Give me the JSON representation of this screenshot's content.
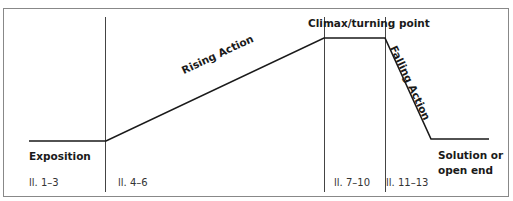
{
  "diagram": {
    "colors": {
      "line": "#1a1a1a",
      "divider": "#444444",
      "border": "#888888",
      "background": "#ffffff"
    },
    "stages": [
      {
        "label": "Exposition",
        "lines": "ll. 1–3"
      },
      {
        "label": "Rising Action",
        "lines": "ll. 4–6"
      },
      {
        "label": "Climax/turning point",
        "lines": "ll. 7–10"
      },
      {
        "label": "Falling Action",
        "lines": "ll. 11–13"
      },
      {
        "label_line1": "Solution or",
        "label_line2": "open end"
      }
    ],
    "curve_points": [
      [
        29,
        141
      ],
      [
        106,
        141
      ],
      [
        324,
        38
      ],
      [
        385,
        38
      ],
      [
        431,
        139
      ],
      [
        489,
        139
      ]
    ],
    "dividers_x": [
      105,
      324,
      385
    ]
  }
}
